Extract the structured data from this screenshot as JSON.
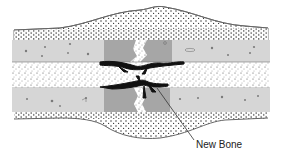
{
  "diagram": {
    "labels": [
      {
        "id": "new-bone",
        "text": "New Bone"
      }
    ],
    "regions": [
      "callus-top",
      "cortex-upper",
      "medullary-cavity",
      "cortex-lower",
      "callus-bottom",
      "fracture-line",
      "new-bone"
    ],
    "colors": {
      "background": "#ffffff",
      "cortex": "#d4d4d4",
      "cortex_fragment": "#9e9e9e",
      "stipple": "#2a2a2a",
      "new_bone": "#111111",
      "outline": "#555555"
    }
  }
}
